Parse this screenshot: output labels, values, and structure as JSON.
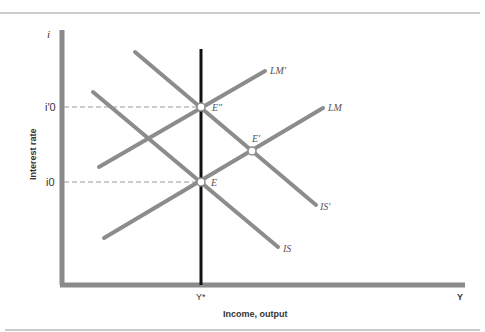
{
  "diagram": {
    "type": "IS-LM",
    "y_axis_symbol": "i",
    "y_axis_title": "Interest rate",
    "x_axis_symbol": "Y",
    "x_axis_title": "Income, output",
    "x_tick": "Y*",
    "y_ticks": {
      "upper": "i′0",
      "lower": "i0"
    },
    "curves": {
      "lm": "LM",
      "lm_prime": "LM′",
      "is": "IS",
      "is_prime": "IS′"
    },
    "points": {
      "e": "E",
      "e_prime": "E′",
      "e_double_prime": "E″"
    },
    "colors": {
      "curve": "#8c8c8c",
      "axis": "#8a8a8a",
      "full_employment": "#111111",
      "dash": "#999999"
    }
  }
}
